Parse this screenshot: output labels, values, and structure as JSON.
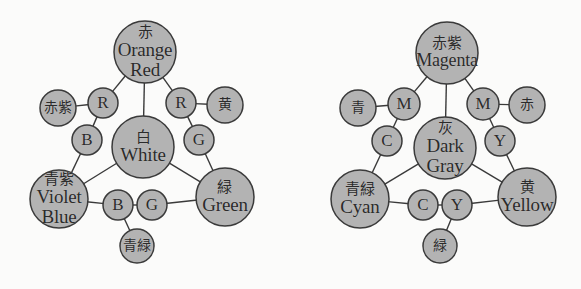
{
  "figure": {
    "background_color": "#fbfbfa",
    "node_fill_color": "#b3b3b3",
    "node_stroke_color": "#3a3a3a",
    "edge_color": "#3a3a3a",
    "text_color": "#2b2b2b"
  },
  "diagrams": [
    {
      "id": "additive-rgb",
      "center_node": {
        "jp": "白",
        "en": "White"
      },
      "primary_nodes": [
        {
          "id": "orange-red",
          "jp": "赤",
          "en": "Orange\nRed",
          "en_line1": "Orange",
          "en_line2": "Red"
        },
        {
          "id": "violet-blue",
          "jp": "青紫",
          "en_line1": "Violet",
          "en_line2": "Blue"
        },
        {
          "id": "green",
          "jp": "緑",
          "en_line1": "Green",
          "en_line2": ""
        }
      ],
      "secondary_nodes": [
        {
          "id": "magenta-jp",
          "jp": "赤紫"
        },
        {
          "id": "yellow-jp",
          "jp": "黄"
        },
        {
          "id": "cyan-jp",
          "jp": "青緑"
        }
      ],
      "channel_nodes": [
        {
          "id": "r-left",
          "label": "R"
        },
        {
          "id": "r-right",
          "label": "R"
        },
        {
          "id": "b-left",
          "label": "B"
        },
        {
          "id": "g-right",
          "label": "G"
        },
        {
          "id": "b-bottom",
          "label": "B"
        },
        {
          "id": "g-bottom",
          "label": "G"
        }
      ]
    },
    {
      "id": "subtractive-cmy",
      "center_node": {
        "jp": "灰",
        "en_line1": "Dark",
        "en_line2": "Gray"
      },
      "primary_nodes": [
        {
          "id": "magenta",
          "jp": "赤紫",
          "en_line1": "Magenta",
          "en_line2": ""
        },
        {
          "id": "cyan",
          "jp": "青緑",
          "en_line1": "Cyan",
          "en_line2": ""
        },
        {
          "id": "yellow",
          "jp": "黄",
          "en_line1": "Yellow",
          "en_line2": ""
        }
      ],
      "secondary_nodes": [
        {
          "id": "blue-jp",
          "jp": "青"
        },
        {
          "id": "red-jp",
          "jp": "赤"
        },
        {
          "id": "green-jp",
          "jp": "緑"
        }
      ],
      "channel_nodes": [
        {
          "id": "m-left",
          "label": "M"
        },
        {
          "id": "m-right",
          "label": "M"
        },
        {
          "id": "c-left",
          "label": "C"
        },
        {
          "id": "y-right",
          "label": "Y"
        },
        {
          "id": "c-bottom",
          "label": "C"
        },
        {
          "id": "y-bottom",
          "label": "Y"
        }
      ]
    }
  ],
  "chart_data": {
    "type": "diagram",
    "title": "",
    "graphs": [
      {
        "name": "additive-rgb",
        "nodes": [
          {
            "id": "orange-red",
            "jp": "赤",
            "en": "Orange Red",
            "cx": 145,
            "cy": 52,
            "r": 31,
            "size": "large"
          },
          {
            "id": "magenta-jp",
            "jp": "赤紫",
            "en": "",
            "cx": 58,
            "cy": 108,
            "r": 18,
            "size": "medium"
          },
          {
            "id": "r-left",
            "jp": "",
            "en": "R",
            "cx": 103,
            "cy": 103,
            "r": 15,
            "size": "small"
          },
          {
            "id": "r-right",
            "jp": "",
            "en": "R",
            "cx": 181,
            "cy": 103,
            "r": 15,
            "size": "small"
          },
          {
            "id": "yellow-jp",
            "jp": "黄",
            "en": "",
            "cx": 225,
            "cy": 105,
            "r": 18,
            "size": "medium"
          },
          {
            "id": "b-left",
            "jp": "",
            "en": "B",
            "cx": 87,
            "cy": 140,
            "r": 15,
            "size": "small"
          },
          {
            "id": "white",
            "jp": "白",
            "en": "White",
            "cx": 143,
            "cy": 147,
            "r": 31,
            "size": "large"
          },
          {
            "id": "g-right",
            "jp": "",
            "en": "G",
            "cx": 199,
            "cy": 140,
            "r": 15,
            "size": "small"
          },
          {
            "id": "violet-blue",
            "jp": "青紫",
            "en": "Violet Blue",
            "cx": 59,
            "cy": 199,
            "r": 29,
            "size": "large"
          },
          {
            "id": "green",
            "jp": "緑",
            "en": "Green",
            "cx": 225,
            "cy": 197,
            "r": 29,
            "size": "large"
          },
          {
            "id": "b-bottom",
            "jp": "",
            "en": "B",
            "cx": 118,
            "cy": 205,
            "r": 15,
            "size": "small"
          },
          {
            "id": "g-bottom",
            "jp": "",
            "en": "G",
            "cx": 152,
            "cy": 205,
            "r": 15,
            "size": "small"
          },
          {
            "id": "cyan-jp",
            "jp": "青緑",
            "en": "",
            "cx": 137,
            "cy": 246,
            "r": 17,
            "size": "medium"
          }
        ],
        "edges": [
          [
            "orange-red",
            "r-left"
          ],
          [
            "orange-red",
            "white"
          ],
          [
            "orange-red",
            "r-right"
          ],
          [
            "magenta-jp",
            "r-left"
          ],
          [
            "r-left",
            "b-left"
          ],
          [
            "b-left",
            "violet-blue"
          ],
          [
            "r-right",
            "yellow-jp"
          ],
          [
            "r-right",
            "g-right"
          ],
          [
            "g-right",
            "green"
          ],
          [
            "white",
            "violet-blue"
          ],
          [
            "white",
            "green"
          ],
          [
            "violet-blue",
            "b-bottom"
          ],
          [
            "b-bottom",
            "g-bottom"
          ],
          [
            "g-bottom",
            "green"
          ],
          [
            "b-bottom",
            "cyan-jp"
          ]
        ]
      },
      {
        "name": "subtractive-cmy",
        "nodes": [
          {
            "id": "magenta",
            "jp": "赤紫",
            "en": "Magenta",
            "cx": 447,
            "cy": 53,
            "r": 31,
            "size": "large"
          },
          {
            "id": "blue-jp",
            "jp": "青",
            "en": "",
            "cx": 358,
            "cy": 108,
            "r": 18,
            "size": "medium"
          },
          {
            "id": "m-left",
            "jp": "",
            "en": "M",
            "cx": 404,
            "cy": 104,
            "r": 16,
            "size": "small"
          },
          {
            "id": "m-right",
            "jp": "",
            "en": "M",
            "cx": 483,
            "cy": 104,
            "r": 16,
            "size": "small"
          },
          {
            "id": "red-jp",
            "jp": "赤",
            "en": "",
            "cx": 527,
            "cy": 105,
            "r": 18,
            "size": "medium"
          },
          {
            "id": "c-left",
            "jp": "",
            "en": "C",
            "cx": 387,
            "cy": 141,
            "r": 15,
            "size": "small"
          },
          {
            "id": "dark-gray",
            "jp": "灰",
            "en": "Dark Gray",
            "cx": 445,
            "cy": 148,
            "r": 31,
            "size": "large"
          },
          {
            "id": "y-right",
            "jp": "",
            "en": "Y",
            "cx": 500,
            "cy": 141,
            "r": 15,
            "size": "small"
          },
          {
            "id": "cyan",
            "jp": "青緑",
            "en": "Cyan",
            "cx": 360,
            "cy": 199,
            "r": 29,
            "size": "large"
          },
          {
            "id": "yellow",
            "jp": "黄",
            "en": "Yellow",
            "cx": 527,
            "cy": 197,
            "r": 29,
            "size": "large"
          },
          {
            "id": "c-bottom",
            "jp": "",
            "en": "C",
            "cx": 423,
            "cy": 205,
            "r": 15,
            "size": "small"
          },
          {
            "id": "y-bottom",
            "jp": "",
            "en": "Y",
            "cx": 457,
            "cy": 205,
            "r": 15,
            "size": "small"
          },
          {
            "id": "green-jp",
            "jp": "緑",
            "en": "",
            "cx": 440,
            "cy": 246,
            "r": 17,
            "size": "medium"
          }
        ],
        "edges": [
          [
            "magenta",
            "m-left"
          ],
          [
            "magenta",
            "dark-gray"
          ],
          [
            "magenta",
            "m-right"
          ],
          [
            "blue-jp",
            "m-left"
          ],
          [
            "m-left",
            "c-left"
          ],
          [
            "c-left",
            "cyan"
          ],
          [
            "m-right",
            "red-jp"
          ],
          [
            "m-right",
            "y-right"
          ],
          [
            "y-right",
            "yellow"
          ],
          [
            "dark-gray",
            "cyan"
          ],
          [
            "dark-gray",
            "yellow"
          ],
          [
            "cyan",
            "c-bottom"
          ],
          [
            "c-bottom",
            "y-bottom"
          ],
          [
            "y-bottom",
            "yellow"
          ],
          [
            "y-bottom",
            "green-jp"
          ]
        ]
      }
    ]
  }
}
